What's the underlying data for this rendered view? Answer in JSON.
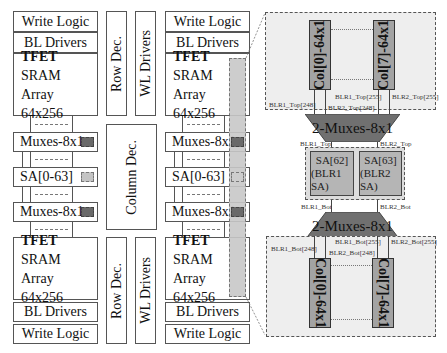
{
  "left_bank": {
    "top": {
      "write_logic": "Write Logic",
      "bl_drivers": "BL Drivers",
      "array": {
        "line1": "TFET",
        "line2": "SRAM",
        "line3": "Array",
        "line4": "64x256"
      }
    },
    "mux_top": "Muxes-8x1",
    "sa": "SA[0-63]",
    "mux_bot": "Muxes-8x1",
    "bottom": {
      "array": {
        "line1": "TFET",
        "line2": "SRAM",
        "line3": "Array",
        "line4": "64x256"
      },
      "bl_drivers": "BL Drivers",
      "write_logic": "Write Logic"
    }
  },
  "center": {
    "row_dec_top": "Row Dec.",
    "wl_drivers_top": "WL Drivers",
    "column_dec": "Column Dec.",
    "row_dec_bot": "Row Dec.",
    "wl_drivers_bot": "WL Drivers"
  },
  "right_bank": {
    "top": {
      "write_logic": "Write Logic",
      "bl_drivers": "BL Drivers",
      "array": {
        "line1": "TFET",
        "line2": "SRAM",
        "line3": "Array",
        "line4": "64x256"
      }
    },
    "mux_top": "Muxes-8x1",
    "sa": "SA[0-63]",
    "mux_bot": "Muxes-8x1",
    "bottom": {
      "array": {
        "line1": "TFET",
        "line2": "SRAM",
        "line3": "Array",
        "line4": "64x256"
      },
      "bl_drivers": "BL Drivers",
      "write_logic": "Write Logic"
    }
  },
  "detail": {
    "top_cols": [
      "Col[0]-64x1",
      "Col[7]-64x1"
    ],
    "top_labels": {
      "blr1_248": "BLR1_Top[248]",
      "blr2_248": "BLR2_Top[248]",
      "blr1_255": "BLR1_Top[255]",
      "blr2_255": "BLR2_Top[255]"
    },
    "mux_top": "2-Muxes-8x1",
    "sa_labels": {
      "blr1_top": "BLR1_Top",
      "blr2_top": "BLR2_Top",
      "blr1_bot": "BLR1_Bot",
      "blr2_bot": "BLR2_Bot"
    },
    "sa62": {
      "line1": "SA[62]",
      "line2": "(BLR1 SA)"
    },
    "sa63": {
      "line1": "SA[63]",
      "line2": "(BLR2 SA)"
    },
    "mux_bot": "2-Muxes-8x1",
    "bot_labels": {
      "blr1_248": "BLR1_Bot[248]",
      "blr2_248": "BLR2_Bot[248]",
      "blr1_255": "BLR1_Bot[255]",
      "blr2_255": "BLR2_Bot[255]"
    },
    "bot_cols": [
      "Col[0]-64x1",
      "Col[7]-64x1"
    ]
  },
  "colors": {
    "region_fill": "#eeeeee",
    "column_fill": "#a3a3a3",
    "mux_fill": "#707070",
    "sa_fill": "#b5b5b5",
    "strip_fill": "#c8c8c8"
  }
}
